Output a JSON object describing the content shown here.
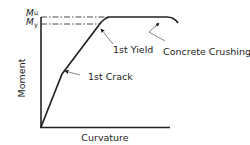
{
  "diagram": {
    "axes": {
      "x_label": "Curvature",
      "y_label": "Moment"
    },
    "levels": {
      "ultimate": {
        "symbol": "M",
        "subscript": "u"
      },
      "yield": {
        "symbol": "M",
        "subscript": "y"
      }
    },
    "annotations": [
      {
        "id": "first-crack",
        "text": "1st Crack"
      },
      {
        "id": "first-yield",
        "text": "1st Yield"
      },
      {
        "id": "concrete-crushing",
        "text": "Concrete Crushing"
      }
    ],
    "colors": {
      "line": "#222222",
      "leader": "#555555",
      "background": "#ffffff"
    }
  }
}
